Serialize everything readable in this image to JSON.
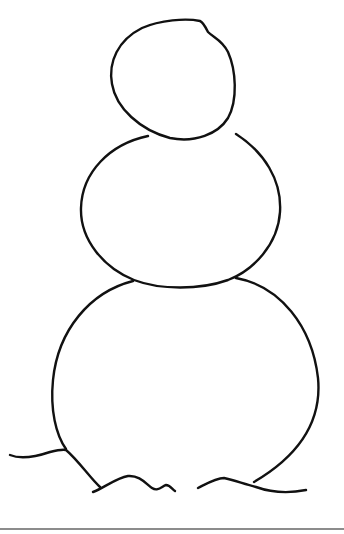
{
  "drawing": {
    "title": "Snowman outline drawing",
    "stroke_color": "#111111",
    "background_color": "#ffffff",
    "parts": [
      {
        "name": "head",
        "shape": "ellipse"
      },
      {
        "name": "middle-body",
        "shape": "ellipse"
      },
      {
        "name": "bottom-body",
        "shape": "circle-open-bottom"
      },
      {
        "name": "snow-ground",
        "shape": "wavy-lines"
      }
    ]
  },
  "footer": {
    "rule_color": "#8c8c8c"
  }
}
